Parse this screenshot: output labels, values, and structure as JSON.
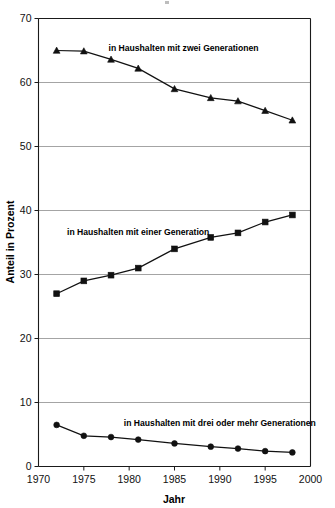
{
  "chart_data": {
    "type": "line",
    "title": "",
    "xlabel": "Jahr",
    "ylabel": "Anteil in Prozent",
    "xlim": [
      1970,
      2000
    ],
    "ylim": [
      0,
      70
    ],
    "grid": true,
    "legend_position": "inline-annotations",
    "x": [
      1972,
      1975,
      1978,
      1981,
      1985,
      1989,
      1992,
      1995,
      1998
    ],
    "xticks": [
      1970,
      1975,
      1980,
      1985,
      1990,
      1995,
      2000
    ],
    "xtick_labels": [
      "1970",
      "1975",
      "1980",
      "1985",
      "1990",
      "1995",
      "2000"
    ],
    "yticks": [
      0,
      10,
      20,
      30,
      40,
      50,
      60,
      70
    ],
    "ytick_labels": [
      "0",
      "10",
      "20",
      "30",
      "40",
      "50",
      "60",
      "70"
    ],
    "series": [
      {
        "name": "in Haushalten mit zwei Generationen",
        "marker": "triangle",
        "values": [
          65.0,
          64.9,
          63.6,
          62.2,
          59.0,
          57.6,
          57.1,
          55.6,
          54.1
        ],
        "label_x": 1986,
        "label_y": 65.0
      },
      {
        "name": "in Haushalten mit einer Generation",
        "marker": "square",
        "values": [
          27.0,
          29.0,
          29.9,
          31.0,
          34.0,
          35.8,
          36.5,
          38.2,
          39.3
        ],
        "label_x": 1981,
        "label_y": 36.2
      },
      {
        "name": "in Haushalten mit drei oder mehr Generationen",
        "marker": "circle",
        "values": [
          6.5,
          4.8,
          4.6,
          4.2,
          3.6,
          3.1,
          2.8,
          2.4,
          2.2
        ],
        "label_x": 1990,
        "label_y": 6.4
      }
    ]
  },
  "axis": {
    "x_title": "Jahr",
    "y_title": "Anteil in Prozent"
  },
  "annotations": {
    "series_1_label": "in Haushalten mit zwei Generationen",
    "series_2_label": "in Haushalten mit einer Generation",
    "series_3_label": "in Haushalten mit drei oder mehr Generationen"
  },
  "colors": {
    "ink": "#111111",
    "grid": "#8d8d8d",
    "background": "#ffffff"
  }
}
